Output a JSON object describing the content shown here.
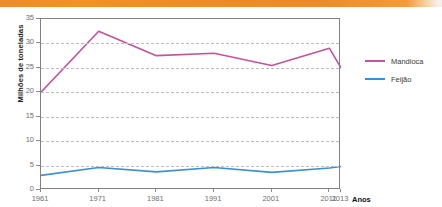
{
  "header": {
    "band_text": "",
    "band_color": "#F2901F"
  },
  "chart_data": {
    "type": "line",
    "title": "",
    "xlabel": "Anos",
    "ylabel": "Milhões de toneladas",
    "x": [
      1961,
      1971,
      1981,
      1991,
      2001,
      2011,
      2013
    ],
    "categories": [
      "1961",
      "1971",
      "1981",
      "1991",
      "2001",
      "2011",
      "2013"
    ],
    "xtick_labels": [
      "1961",
      "1971",
      "1981",
      "1991",
      "2001",
      "2011",
      "2013"
    ],
    "ytick_labels": [
      "35",
      "30",
      "25",
      "20",
      "15",
      "10",
      "5",
      "0"
    ],
    "ylim": [
      0,
      35
    ],
    "ytick_step": 5,
    "grid": true,
    "grid_style": "dashed-horizontal",
    "legend_position": "right",
    "series": [
      {
        "name": "Mandioca",
        "color": "#C4539A",
        "values": [
          20.0,
          32.5,
          27.5,
          28.0,
          25.5,
          29.0,
          25.0
        ]
      },
      {
        "name": "Feijão",
        "color": "#3D8FD1",
        "values": [
          3.0,
          4.6,
          3.7,
          4.6,
          3.6,
          4.5,
          4.8
        ]
      }
    ]
  },
  "legend": {
    "items": [
      {
        "label": "Mandioca",
        "color": "#C4539A"
      },
      {
        "label": "Feijão",
        "color": "#3D8FD1"
      }
    ]
  }
}
